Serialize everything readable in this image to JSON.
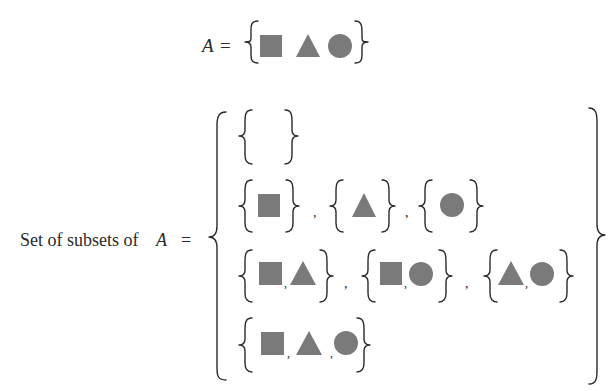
{
  "colors": {
    "shape_fill": "#7a7a7a",
    "ink": "#2a2a2a",
    "background": "#ffffff"
  },
  "top": {
    "lhs_var": "A",
    "equals": "=",
    "elements": [
      "square",
      "triangle",
      "circle"
    ]
  },
  "subsets": {
    "label": "Set of subsets of",
    "lhs_var": "A",
    "equals": "=",
    "separator": ",",
    "rows": [
      {
        "sets": [
          []
        ]
      },
      {
        "sets": [
          [
            "square"
          ],
          [
            "triangle"
          ],
          [
            "circle"
          ]
        ]
      },
      {
        "sets": [
          [
            "square",
            "triangle"
          ],
          [
            "square",
            "circle"
          ],
          [
            "triangle",
            "circle"
          ]
        ]
      },
      {
        "sets": [
          [
            "square",
            "triangle",
            "circle"
          ]
        ]
      }
    ]
  }
}
